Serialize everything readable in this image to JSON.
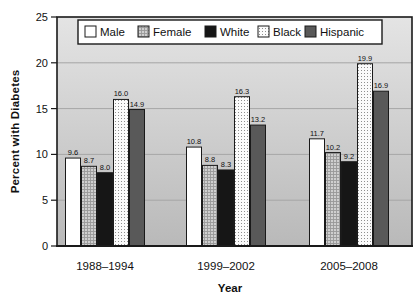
{
  "chart_data": {
    "type": "bar",
    "title": "",
    "xlabel": "Year",
    "ylabel": "Percent with Diabetes",
    "ylim": [
      0,
      25
    ],
    "yticks": [
      0,
      5,
      10,
      15,
      20,
      25
    ],
    "grid": "horizontal gridlines at 5, 10, 15, 20",
    "legend_position": "top-center inside plot area",
    "categories": [
      "1988–1994",
      "1999–2002",
      "2005–2008"
    ],
    "series": [
      {
        "name": "Male",
        "pattern": "solid",
        "color": "#ffffff",
        "values": [
          9.6,
          10.8,
          11.7
        ]
      },
      {
        "name": "Female",
        "pattern": "crosshatch",
        "color": "#cfcfcf",
        "pattern_color": "#999999",
        "values": [
          8.7,
          8.8,
          10.2
        ]
      },
      {
        "name": "White",
        "pattern": "solid",
        "color": "#161616",
        "values": [
          8.0,
          8.3,
          9.2
        ]
      },
      {
        "name": "Black",
        "pattern": "stipple",
        "color": "#fbfbfb",
        "pattern_color": "#8f8f8f",
        "values": [
          16.0,
          16.3,
          19.9
        ]
      },
      {
        "name": "Hispanic",
        "pattern": "solid",
        "color": "#595959",
        "values": [
          14.9,
          13.2,
          16.9
        ]
      }
    ],
    "bar_value_labels": [
      [
        "9.6",
        "8.7",
        "8.0",
        "16.0",
        "14.9"
      ],
      [
        "10.8",
        "8.8",
        "8.3",
        "16.3",
        "13.2"
      ],
      [
        "11.7",
        "10.2",
        "9.2",
        "19.9",
        "16.9"
      ]
    ],
    "colors": {
      "plot_bg_top": "#e4e4e4",
      "plot_bg_bottom": "#b9b9b9",
      "gridline": "#a6a6a6",
      "frame": "#1a1a1a",
      "text": "#111111",
      "figure_bg": "#ffffff"
    }
  }
}
